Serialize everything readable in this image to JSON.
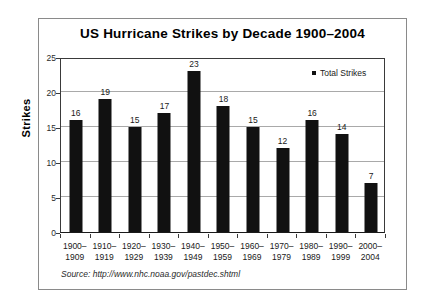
{
  "figure": {
    "background": "#ffffff",
    "frame_color": "#8a8a8a",
    "source_note": "Source: http://www.nhc.noaa.gov/pastdec.shtml"
  },
  "legend": {
    "label": "Total Strikes",
    "swatch_color": "#111111",
    "position": "top-right-inside"
  },
  "chart_data": {
    "type": "bar",
    "title": "US Hurricane Strikes by Decade 1900–2004",
    "xlabel": "",
    "ylabel": "Strikes",
    "categories": [
      "1900–\n1909",
      "1910–\n1919",
      "1920–\n1929",
      "1930–\n1939",
      "1940–\n1949",
      "1950–\n1959",
      "1960–\n1969",
      "1970–\n1979",
      "1980–\n1989",
      "1990–\n1999",
      "2000–\n2004"
    ],
    "category_lines": [
      [
        "1900–",
        "1909"
      ],
      [
        "1910–",
        "1919"
      ],
      [
        "1920–",
        "1929"
      ],
      [
        "1930–",
        "1939"
      ],
      [
        "1940–",
        "1949"
      ],
      [
        "1950–",
        "1959"
      ],
      [
        "1960–",
        "1969"
      ],
      [
        "1970–",
        "1979"
      ],
      [
        "1980–",
        "1989"
      ],
      [
        "1990–",
        "1999"
      ],
      [
        "2000–",
        "2004"
      ]
    ],
    "series": [
      {
        "name": "Total Strikes",
        "color": "#111111",
        "values": [
          16,
          19,
          15,
          17,
          23,
          18,
          15,
          12,
          16,
          14,
          7
        ]
      }
    ],
    "values": [
      16,
      19,
      15,
      17,
      23,
      18,
      15,
      12,
      16,
      14,
      7
    ],
    "data_labels": [
      "16",
      "19",
      "15",
      "17",
      "23",
      "18",
      "15",
      "12",
      "16",
      "14",
      "7"
    ],
    "ylim": [
      0,
      25
    ],
    "yticks": [
      0,
      5,
      10,
      15,
      20,
      25
    ],
    "ytick_labels": [
      "0",
      "5",
      "10",
      "15",
      "20",
      "25"
    ],
    "grid": "horizontal",
    "legend_position": "inside top-right"
  }
}
